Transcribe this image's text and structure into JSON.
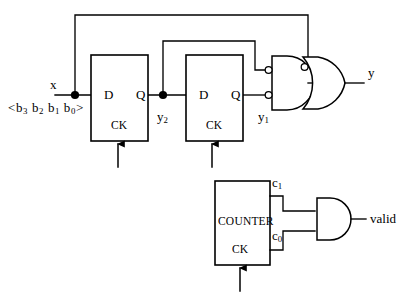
{
  "diagram": {
    "background": "#ffffff",
    "stroke": "#000000",
    "width": 406,
    "height": 296
  },
  "labels": {
    "input_x": "x",
    "input_bus_prefix": "<b",
    "input_bus": "<b3 b2 b1 b0>",
    "bus_parts": {
      "b3": "b",
      "b3s": "3",
      "b2": "b",
      "b2s": "2",
      "b1": "b",
      "b1s": "1",
      "b0": "b",
      "b0s": "0"
    },
    "y2": "y",
    "y2_sub": "2",
    "y1": "y",
    "y1_sub": "1",
    "c1": "c",
    "c1_sub": "1",
    "c0": "c",
    "c0_sub": "0",
    "output_y": "y",
    "output_valid": "valid"
  },
  "blocks": [
    {
      "id": "ff1",
      "name": "d-flip-flop-1",
      "d_label": "D",
      "q_label": "Q",
      "ck_label": "CK",
      "x": 91,
      "y": 55,
      "w": 57,
      "h": 86
    },
    {
      "id": "ff2",
      "name": "d-flip-flop-2",
      "d_label": "D",
      "q_label": "Q",
      "ck_label": "CK",
      "x": 186,
      "y": 55,
      "w": 57,
      "h": 86
    },
    {
      "id": "counter",
      "name": "counter",
      "block_label": "COUNTER",
      "ck_label": "CK",
      "x": 215,
      "y": 181,
      "w": 55,
      "h": 84
    }
  ],
  "gates": [
    {
      "id": "and1",
      "type": "and",
      "name": "and-gate-y",
      "inputs_inverted": true,
      "input_count": 2,
      "output_to": "or1"
    },
    {
      "id": "or1",
      "type": "or",
      "name": "or-gate-y",
      "top_input_inverted": true,
      "input_count": 2,
      "output_label": "y"
    },
    {
      "id": "and2",
      "type": "and",
      "name": "and-gate-valid",
      "inputs_inverted": false,
      "input_count": 2,
      "output_label": "valid"
    }
  ],
  "nodes": [
    {
      "name": "junction-x",
      "x": 75,
      "y": 95
    },
    {
      "name": "junction-y2",
      "x": 163,
      "y": 95
    }
  ],
  "clocks": [
    {
      "name": "clock-arrow-ff1",
      "x": 118,
      "y_from": 166,
      "y_to": 141
    },
    {
      "name": "clock-arrow-ff2",
      "x": 212,
      "y_from": 166,
      "y_to": 141
    },
    {
      "name": "clock-arrow-counter",
      "x": 240,
      "y_from": 290,
      "y_to": 265
    }
  ]
}
